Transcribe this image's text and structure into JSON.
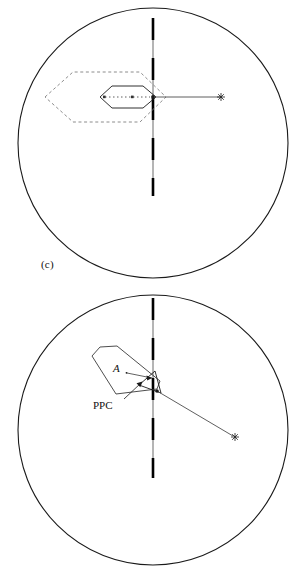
{
  "figure": {
    "type": "stereographic-pole-figure-pair",
    "background": "#ffffff",
    "line_color": "#1a1a1a",
    "thin_line_color": "#555555",
    "dashed_color": "#777777"
  },
  "panels": [
    {
      "id": "c",
      "label": "(c)",
      "circle": {
        "cx": 153,
        "cy": 143,
        "r": 135
      },
      "trace_line": {
        "name": "vertical-trace-line",
        "x": 153,
        "y1": 18,
        "y2": 196,
        "style": "gray-solid-with-black-dashes",
        "dash_pattern": "22 18"
      },
      "arrow": {
        "name": "horizontal-arrow",
        "x1": 153,
        "y1": 97,
        "x2": 222,
        "y2": 97,
        "marker": "star"
      },
      "inner_polygon": {
        "name": "inner-solid-hexagon",
        "style": "solid",
        "points": "100,97 112,86 143,86 156,97 143,108 112,108"
      },
      "outer_polygon": {
        "name": "outer-dashed-hexagon",
        "style": "dashed",
        "points": "45,97 73,72 140,72 166,97 140,122 73,122"
      },
      "dotted_segment": {
        "name": "inner-dotted-segment",
        "x1": 105,
        "y1": 97,
        "x2": 150,
        "y2": 97
      }
    },
    {
      "id": "d",
      "label": "(d)",
      "circle": {
        "cx": 153,
        "cy": 430,
        "r": 135
      },
      "trace_line": {
        "name": "vertical-trace-line",
        "x": 153,
        "y1": 298,
        "y2": 478,
        "style": "gray-solid-with-black-dashes",
        "dash_pattern": "22 18"
      },
      "arrow": {
        "name": "oblique-arrow",
        "x1": 156,
        "y1": 394,
        "x2": 235,
        "y2": 437,
        "marker": "star"
      },
      "polygon": {
        "name": "pentagon-outline",
        "style": "solid",
        "points": "92,356 100,347 117,346 160,381 157,389 116,394"
      },
      "inner_triangle": {
        "name": "inner-triangle",
        "points": "139,385 155,372 161,393"
      },
      "annotations": [
        {
          "name": "label-A",
          "text": "A",
          "x": 117,
          "y": 369,
          "leader": {
            "x1": 126,
            "y1": 373,
            "x2": 155,
            "y2": 377
          }
        },
        {
          "name": "label-PPC",
          "text": "PPC",
          "x": 96,
          "y": 409,
          "leader": {
            "x1": 122,
            "y1": 401,
            "x2": 140,
            "y2": 384
          }
        }
      ]
    }
  ]
}
